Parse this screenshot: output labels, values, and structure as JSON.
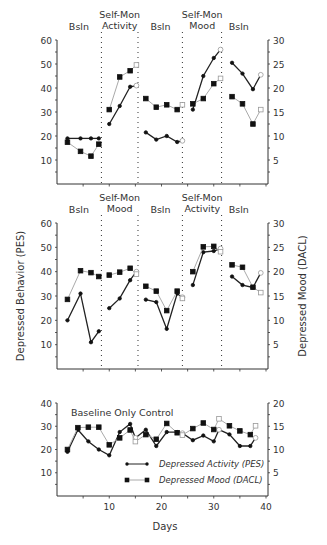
{
  "figure": {
    "y_left_label": "Depressed Behavior (PES)",
    "y_right_label": "Depressed Mood (DACL)",
    "x_label": "Days"
  },
  "chart_data": [
    {
      "type": "line",
      "panel": "top",
      "phase_labels": [
        {
          "label": [
            "Bsln"
          ],
          "x_day": 4.2
        },
        {
          "label": [
            "Self-Mon",
            "Activity"
          ],
          "x_day": 12
        },
        {
          "label": [
            "Bsln"
          ],
          "x_day": 19.8
        },
        {
          "label": [
            "Self-Mon",
            "Mood"
          ],
          "x_day": 27.8
        },
        {
          "label": [
            "Bsln"
          ],
          "x_day": 34.8
        }
      ],
      "phase_dividers": [
        8.5,
        15.5,
        24,
        31.5
      ],
      "xlim": [
        0,
        40
      ],
      "ylim_left": [
        0,
        60
      ],
      "ylim_right": [
        0,
        30
      ],
      "yticks_left": [
        10,
        20,
        30,
        40,
        50,
        60
      ],
      "yticks_right": [
        5,
        10,
        15,
        20,
        25,
        30
      ],
      "series": [
        {
          "name": "Depressed Activity (PES)",
          "axis": "left",
          "marker": "dot",
          "color": "#333333",
          "segments": [
            [
              [
                2,
                19
              ],
              [
                4.5,
                19
              ],
              [
                6.5,
                19
              ],
              [
                8,
                19
              ]
            ],
            [
              [
                10,
                25
              ],
              [
                12,
                32.5
              ],
              [
                14,
                40.5
              ],
              [
                15.2,
                41,
                "open"
              ]
            ],
            [
              [
                17,
                21.5
              ],
              [
                19,
                18.5
              ],
              [
                21,
                20
              ],
              [
                23,
                17.5
              ],
              [
                24,
                18,
                "open"
              ]
            ],
            [
              [
                26,
                31
              ],
              [
                28,
                45
              ],
              [
                30,
                52.5
              ],
              [
                31.3,
                56,
                "open"
              ]
            ],
            [
              [
                33.5,
                50.5
              ],
              [
                35.5,
                46
              ],
              [
                37.5,
                39.5
              ],
              [
                39,
                45.5,
                "open"
              ]
            ]
          ]
        },
        {
          "name": "Depressed Mood (DACL)",
          "axis": "right",
          "marker": "square",
          "color": "#999999",
          "segments": [
            [
              [
                2,
                8.7
              ],
              [
                4.5,
                6.8
              ],
              [
                6.5,
                5.8
              ],
              [
                8,
                8.3
              ]
            ],
            [
              [
                10,
                15.5
              ],
              [
                12,
                22.3
              ],
              [
                14,
                23.6
              ],
              [
                15.2,
                24.8,
                "open"
              ]
            ],
            [
              [
                17,
                17.8
              ],
              [
                19,
                16
              ],
              [
                21,
                16.5
              ],
              [
                23,
                15.5
              ],
              [
                24,
                16.5,
                "open"
              ]
            ],
            [
              [
                26,
                16.7
              ],
              [
                28,
                17.8
              ],
              [
                30,
                20.9
              ],
              [
                31.3,
                22,
                "open"
              ]
            ],
            [
              [
                33.5,
                18.2
              ],
              [
                35.5,
                16.7
              ],
              [
                37.5,
                12.5
              ],
              [
                39,
                15.5,
                "open"
              ]
            ]
          ]
        }
      ]
    },
    {
      "type": "line",
      "panel": "middle",
      "phase_labels": [
        {
          "label": [
            "Bsln"
          ],
          "x_day": 4.2
        },
        {
          "label": [
            "Self-Mon",
            "Mood"
          ],
          "x_day": 12
        },
        {
          "label": [
            "Bsln"
          ],
          "x_day": 19.8
        },
        {
          "label": [
            "Self-Mon",
            "Activity"
          ],
          "x_day": 27.8
        },
        {
          "label": [
            "Bsln"
          ],
          "x_day": 34.8
        }
      ],
      "phase_dividers": [
        8.5,
        15.5,
        24,
        31.5
      ],
      "xlim": [
        0,
        40
      ],
      "ylim_left": [
        0,
        60
      ],
      "ylim_right": [
        0,
        30
      ],
      "yticks_left": [
        10,
        20,
        30,
        40,
        50,
        60
      ],
      "yticks_right": [
        5,
        10,
        15,
        20,
        25,
        30
      ],
      "series": [
        {
          "name": "Depressed Activity (PES)",
          "axis": "left",
          "marker": "dot",
          "color": "#333333",
          "segments": [
            [
              [
                2,
                20
              ],
              [
                4.5,
                31
              ],
              [
                6.5,
                11
              ],
              [
                8,
                15.5
              ]
            ],
            [
              [
                10,
                25
              ],
              [
                12,
                29
              ],
              [
                14,
                36.5
              ],
              [
                15.2,
                40,
                "open"
              ]
            ],
            [
              [
                17,
                28.5
              ],
              [
                19,
                27.5
              ],
              [
                21,
                16.5
              ],
              [
                23,
                31
              ],
              [
                24,
                29.5,
                "open"
              ]
            ],
            [
              [
                26,
                34.5
              ],
              [
                28,
                48
              ],
              [
                30,
                48.5
              ],
              [
                31.3,
                49.5,
                "open"
              ]
            ],
            [
              [
                33.5,
                38
              ],
              [
                35.5,
                34.5
              ],
              [
                37.5,
                33.5
              ],
              [
                39,
                39.5,
                "open"
              ]
            ]
          ]
        },
        {
          "name": "Depressed Mood (DACL)",
          "axis": "right",
          "marker": "square",
          "color": "#999999",
          "segments": [
            [
              [
                2,
                14.3
              ],
              [
                4.5,
                20.2
              ],
              [
                6.5,
                19.8
              ],
              [
                8,
                19
              ]
            ],
            [
              [
                10,
                19.3
              ],
              [
                12,
                19.9
              ],
              [
                14,
                20.7
              ],
              [
                15.2,
                19.5,
                "open"
              ]
            ],
            [
              [
                17,
                17
              ],
              [
                19,
                16
              ],
              [
                21,
                12
              ],
              [
                23,
                16
              ],
              [
                24,
                14.5,
                "open"
              ]
            ],
            [
              [
                26,
                20
              ],
              [
                28,
                25.1
              ],
              [
                30,
                25.2
              ],
              [
                31.3,
                24.1,
                "open"
              ]
            ],
            [
              [
                33.5,
                21.4
              ],
              [
                35.5,
                20.9
              ],
              [
                37.5,
                16.8
              ],
              [
                39,
                15.7,
                "open"
              ]
            ]
          ]
        }
      ]
    },
    {
      "type": "line",
      "panel": "bottom",
      "title": "Baseline Only Control",
      "xlabel": "Days",
      "xlim": [
        0,
        40
      ],
      "xticks": [
        10,
        20,
        30,
        40
      ],
      "ylim_left": [
        0,
        40
      ],
      "ylim_right": [
        0,
        20
      ],
      "yticks_left": [
        10,
        20,
        30,
        40
      ],
      "yticks_right": [
        5,
        10,
        15,
        20
      ],
      "legend": [
        {
          "label": "Depressed Activity (PES)",
          "marker": "dot"
        },
        {
          "label": "Depressed Mood (DACL)",
          "marker": "square"
        }
      ],
      "series": [
        {
          "name": "Depressed Activity (PES)",
          "axis": "left",
          "marker": "dot",
          "color": "#333333",
          "segments": [
            [
              [
                2,
                19
              ],
              [
                4,
                28.5
              ],
              [
                6,
                23.5
              ],
              [
                8,
                20
              ],
              [
                10,
                17.5
              ],
              [
                12,
                27.5
              ],
              [
                14,
                31
              ],
              [
                15,
                25,
                "open"
              ],
              [
                17,
                28.5
              ],
              [
                19,
                21.5
              ],
              [
                21,
                27.5
              ],
              [
                23,
                27.5
              ],
              [
                24,
                27,
                "open"
              ],
              [
                26,
                24
              ],
              [
                28,
                26
              ],
              [
                30,
                23.5
              ],
              [
                31,
                28.5,
                "open"
              ],
              [
                33,
                26.5
              ],
              [
                35,
                21.5
              ],
              [
                37,
                21.5
              ],
              [
                38,
                25,
                "open"
              ]
            ]
          ]
        },
        {
          "name": "Depressed Mood (DACL)",
          "axis": "right",
          "marker": "square",
          "color": "#999999",
          "segments": [
            [
              [
                2,
                10
              ],
              [
                4,
                14.7
              ],
              [
                6,
                14.8
              ],
              [
                8,
                14.8
              ],
              [
                10,
                11
              ],
              [
                12,
                12.5
              ],
              [
                14,
                14.2
              ],
              [
                15,
                11.7,
                "open"
              ],
              [
                17,
                13.2
              ],
              [
                19,
                12.2
              ],
              [
                21,
                15.6
              ],
              [
                23,
                13.6
              ],
              [
                24,
                13.1,
                "open"
              ],
              [
                26,
                14.5
              ],
              [
                28,
                15.7
              ],
              [
                30,
                14.3
              ],
              [
                31,
                16.6,
                "open"
              ],
              [
                33,
                15.1
              ],
              [
                35,
                14
              ],
              [
                37,
                13.2
              ],
              [
                38,
                15.1,
                "open"
              ]
            ]
          ]
        }
      ]
    }
  ]
}
